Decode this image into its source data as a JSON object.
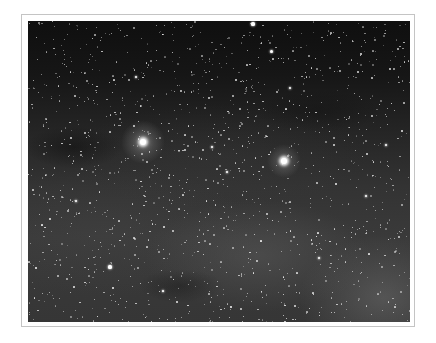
{
  "image": {
    "subject": "star field photograph with two bright stars and Milky Way glow",
    "frame_color": "#c4c4c4",
    "mat_color": "#ffffff",
    "sky_top_color": "#0f0f0f",
    "sky_bottom_color": "#3a3a3a"
  },
  "bright_stars": [
    {
      "name": "bright-star-left",
      "x": 115,
      "y": 121,
      "core": 6,
      "glow": 44,
      "glow_opacity": 0.35
    },
    {
      "name": "bright-star-right",
      "x": 256,
      "y": 140,
      "core": 6,
      "glow": 34,
      "glow_opacity": 0.3
    }
  ],
  "notable_stars": [
    {
      "x": 225,
      "y": 3,
      "r": 1.6
    },
    {
      "x": 243,
      "y": 30,
      "r": 1.5
    },
    {
      "x": 82,
      "y": 246,
      "r": 1.6
    },
    {
      "x": 291,
      "y": 237,
      "r": 1.3
    },
    {
      "x": 199,
      "y": 151,
      "r": 1.1
    },
    {
      "x": 184,
      "y": 126,
      "r": 1.2
    },
    {
      "x": 108,
      "y": 56,
      "r": 1.1
    },
    {
      "x": 358,
      "y": 124,
      "r": 1.1
    },
    {
      "x": 338,
      "y": 175,
      "r": 1.0
    },
    {
      "x": 262,
      "y": 67,
      "r": 1.0
    },
    {
      "x": 135,
      "y": 270,
      "r": 1.0
    },
    {
      "x": 48,
      "y": 180,
      "r": 1.0
    }
  ],
  "field": {
    "seed": 1337,
    "count": 1400,
    "min_r": 0.35,
    "max_r": 0.9
  }
}
